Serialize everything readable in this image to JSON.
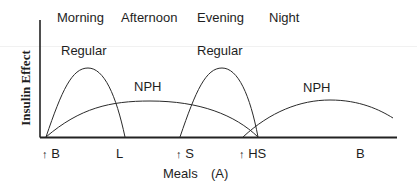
{
  "figure": {
    "panel_label": "(A)",
    "y_axis_label": "Insulin Effect",
    "x_axis_label": "Meals",
    "time_periods": [
      "Morning",
      "Afternoon",
      "Evening",
      "Night"
    ],
    "curve_labels": {
      "regular_1": "Regular",
      "nph_1": "NPH",
      "regular_2": "Regular",
      "nph_2": "NPH"
    },
    "meals": [
      {
        "label": "B",
        "injection": true
      },
      {
        "label": "L",
        "injection": false
      },
      {
        "label": "S",
        "injection": true
      },
      {
        "label": "HS",
        "injection": true
      },
      {
        "label": "B",
        "injection": false
      }
    ],
    "arrow_glyph": "↑",
    "colors": {
      "line": "#2a2a2a",
      "axis": "#222222",
      "text": "#1e1e1e"
    }
  }
}
